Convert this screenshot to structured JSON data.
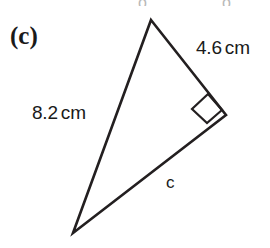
{
  "figure": {
    "part_label": "(c)",
    "type": "right-triangle",
    "background_color": "#ffffff",
    "stroke_color": "#231f20",
    "text_color": "#1a1a1a",
    "labels": {
      "side_a_value": "4.6",
      "side_a_unit": "cm",
      "side_b_value": "8.2",
      "side_b_unit": "cm",
      "side_c": "c"
    },
    "right_angle_marker": "present",
    "cut_marks": {
      "left": "o",
      "right": "o"
    }
  },
  "geometry": {
    "vertex_top": {
      "x": 151,
      "y": 20
    },
    "vertex_right": {
      "x": 226,
      "y": 115
    },
    "vertex_bottom_left": {
      "x": 73,
      "y": 233
    },
    "right_angle_at": "vertex_right",
    "right_angle_square": {
      "p1": {
        "x": 208,
        "y": 94
      },
      "p2": {
        "x": 192,
        "y": 109
      },
      "p3": {
        "x": 207,
        "y": 123
      },
      "p4": {
        "x": 222,
        "y": 110
      }
    },
    "stroke_width": 2.6
  }
}
